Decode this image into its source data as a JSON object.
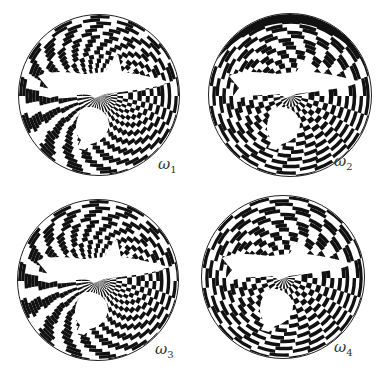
{
  "figure": {
    "panels": [
      {
        "id": "w1",
        "label": "ω",
        "subscript": "1",
        "cx": 99,
        "cy": 95,
        "r": 81,
        "lx": 158,
        "ly": 155,
        "dense_region": "top",
        "coarse_region": "bottom"
      },
      {
        "id": "w2",
        "label": "ω",
        "subscript": "2",
        "cx": 290,
        "cy": 95,
        "r": 82,
        "lx": 334,
        "ly": 152,
        "dense_region": "fish",
        "coarse_region": "edges"
      },
      {
        "id": "w3",
        "label": "ω",
        "subscript": "3",
        "cx": 98,
        "cy": 280,
        "r": 81,
        "lx": 155,
        "ly": 340,
        "dense_region": "left",
        "coarse_region": "bottom"
      },
      {
        "id": "w4",
        "label": "ω",
        "subscript": "4",
        "cx": 283,
        "cy": 277,
        "r": 82,
        "lx": 334,
        "ly": 338,
        "dense_region": "fish",
        "coarse_region": "top"
      }
    ],
    "colors": {
      "ink": "#111111",
      "paper": "#ffffff"
    }
  }
}
